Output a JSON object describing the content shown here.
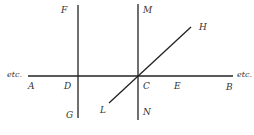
{
  "diagram": {
    "line_color": "#222222",
    "label_color": "#333333",
    "lines": {
      "horizontal_AB": {
        "x1": 28,
        "y1": 76,
        "x2": 233,
        "y2": 76
      },
      "vertical_FG": {
        "x1": 78,
        "y1": 5,
        "x2": 78,
        "y2": 118
      },
      "vertical_MN": {
        "x1": 138,
        "y1": 4,
        "x2": 138,
        "y2": 120
      },
      "diagonal_LH": {
        "x1": 109,
        "y1": 103,
        "x2": 191,
        "y2": 27
      }
    },
    "labels": {
      "F": "F",
      "G": "G",
      "M": "M",
      "N": "N",
      "H": "H",
      "L": "L",
      "A": "A",
      "D": "D",
      "C": "C",
      "E": "E",
      "B": "B",
      "etc_left": "etc.",
      "etc_right": "etc."
    }
  }
}
